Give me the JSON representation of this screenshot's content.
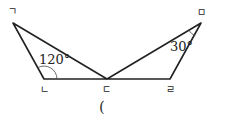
{
  "diagram": {
    "vertices": {
      "a": "ㄱ",
      "b": "ㄴ",
      "c": "ㄷ",
      "d": "ㄹ",
      "e": "ㅁ"
    },
    "angles": {
      "angle_at_b": "120°",
      "angle_at_e": "30°"
    },
    "answer_blank": "("
  },
  "colors": {
    "stroke": "#222222"
  }
}
